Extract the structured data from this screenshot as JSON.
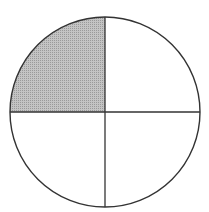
{
  "diagram": {
    "shape": "circle",
    "parts_total": 4,
    "parts_shaded": 1,
    "fraction_shaded": "1/4",
    "shaded_quadrant": "top-left",
    "colors": {
      "stroke": "#333333",
      "shade": "#b5b5b5",
      "background": "#ffffff"
    },
    "geometry": {
      "cx": 105,
      "cy": 112,
      "r": 95
    }
  }
}
